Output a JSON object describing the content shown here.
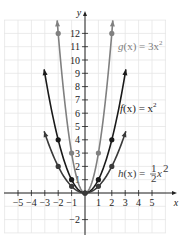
{
  "chart_data": {
    "type": "line",
    "title": "",
    "xlabel": "x",
    "ylabel": "y",
    "xlim": [
      -5.5,
      6
    ],
    "ylim": [
      -2.5,
      13.5
    ],
    "grid": true,
    "x_ticks": [
      -5,
      -4,
      -3,
      -2,
      -1,
      1,
      2,
      3,
      4,
      5
    ],
    "y_ticks": [
      -2,
      1,
      2,
      3,
      4,
      5,
      6,
      7,
      8,
      9,
      10,
      11,
      12
    ],
    "x_tick_labels": [
      "−5",
      "−4",
      "−3",
      "−2",
      "−1",
      "1",
      "2",
      "3",
      "4",
      "5"
    ],
    "y_tick_labels": [
      "−2",
      "1",
      "2",
      "3",
      "4",
      "5",
      "6",
      "7",
      "8",
      "9",
      "10",
      "11",
      "12"
    ],
    "series": [
      {
        "name": "g(x) = 3x^2",
        "label_text": "g(x) = 3x²",
        "coef": 3,
        "domain": [
          -2.08,
          2.08
        ],
        "color": "#808080",
        "points": [
          [
            -2,
            12
          ],
          [
            -1,
            3
          ],
          [
            0,
            0
          ],
          [
            1,
            3
          ],
          [
            2,
            12
          ]
        ]
      },
      {
        "name": "f(x) = x^2",
        "label_text": "f(x) = x²",
        "coef": 1,
        "domain": [
          -3.05,
          3.05
        ],
        "color": "#1a1a1a",
        "points": [
          [
            -2,
            4
          ],
          [
            -1,
            1
          ],
          [
            0,
            0
          ],
          [
            1,
            1
          ],
          [
            2,
            4
          ]
        ]
      },
      {
        "name": "h(x) = 1/2 x^2",
        "label_text": "h(x) = ½x²",
        "coef": 0.5,
        "domain": [
          -3.05,
          3.05
        ],
        "color": "#3a3a3a",
        "points": [
          [
            -2,
            2
          ],
          [
            -1,
            0.5
          ],
          [
            0,
            0
          ],
          [
            1,
            0.5
          ],
          [
            2,
            2
          ]
        ]
      }
    ],
    "annotations": [
      {
        "text": "g(x) = 3x²",
        "x": 2.6,
        "y": 10.8
      },
      {
        "text": "f(x) = x²",
        "x": 2.6,
        "y": 5.8
      },
      {
        "text": "h(x) = ½x²",
        "x": 2.6,
        "y": 1.5
      }
    ]
  },
  "labels": {
    "x_axis": "x",
    "y_axis": "y",
    "g": {
      "name": "g",
      "arg": "(x) = 3x",
      "exp": "2"
    },
    "f": {
      "name": "f",
      "arg": "(x) = x",
      "exp": "2"
    },
    "h": {
      "name": "h",
      "arg": "(x) = ",
      "num": "1",
      "den": "2",
      "var": "x",
      "exp": "2"
    }
  }
}
